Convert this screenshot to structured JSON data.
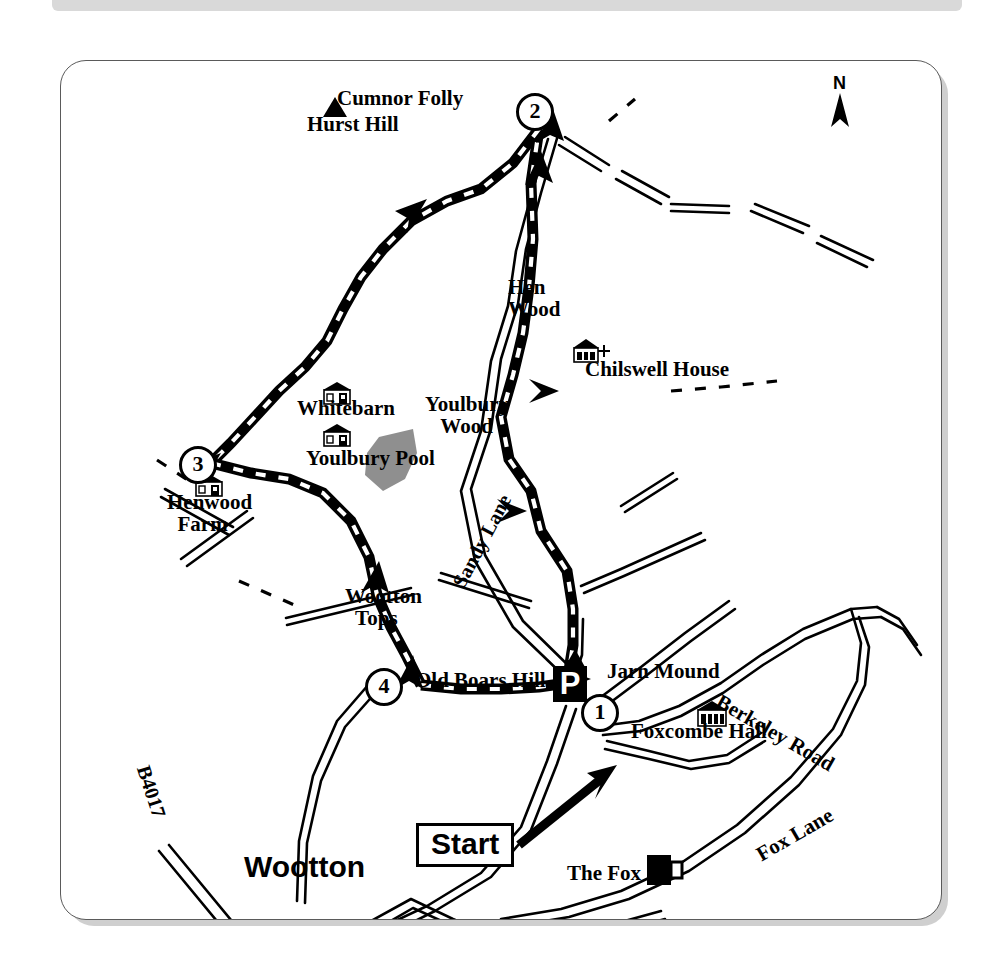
{
  "map": {
    "title": "Wootton / Boars Hill circular walk map",
    "orientation": {
      "north_label": "N"
    },
    "start_marker": {
      "label": "Start"
    },
    "parking_marker": {
      "label": "P"
    },
    "waypoints": [
      {
        "number": "1",
        "x": 596,
        "y": 709
      },
      {
        "number": "2",
        "x": 531,
        "y": 108
      },
      {
        "number": "3",
        "x": 194,
        "y": 461
      },
      {
        "number": "4",
        "x": 380,
        "y": 683
      }
    ],
    "place_labels": [
      {
        "id": "cumnor-folly",
        "text": "Cumnor Folly",
        "x": 336,
        "y": 97,
        "size": 21,
        "align": "left"
      },
      {
        "id": "hurst-hill",
        "text": "Hurst Hill",
        "x": 306,
        "y": 123,
        "size": 21,
        "align": "left"
      },
      {
        "id": "hen-wood",
        "text": "Hen\nWood",
        "x": 507,
        "y": 286,
        "size": 21,
        "align": "left"
      },
      {
        "id": "chilswell-house",
        "text": "Chilswell House",
        "x": 584,
        "y": 368,
        "size": 21,
        "align": "left"
      },
      {
        "id": "whitebarn",
        "text": "Whitebarn",
        "x": 296,
        "y": 407,
        "size": 21,
        "align": "left"
      },
      {
        "id": "youlbury-wood",
        "text": "Youlbury\n   Wood",
        "x": 424,
        "y": 403,
        "size": 21,
        "align": "left"
      },
      {
        "id": "youlbury-pool",
        "text": "Youlbury Pool",
        "x": 305,
        "y": 457,
        "size": 21,
        "align": "left"
      },
      {
        "id": "henwood-farm",
        "text": "Henwood\n  Farm",
        "x": 166,
        "y": 501,
        "size": 21,
        "align": "left"
      },
      {
        "id": "wootton-tops",
        "text": "Wootton\n  Tops",
        "x": 344,
        "y": 595,
        "size": 21,
        "align": "left"
      },
      {
        "id": "old-boars-hill",
        "text": "Old Boars Hill",
        "x": 414,
        "y": 679,
        "size": 21,
        "align": "left"
      },
      {
        "id": "jarn-mound",
        "text": "Jarn Mound",
        "x": 606,
        "y": 670,
        "size": 21,
        "align": "left"
      },
      {
        "id": "foxcombe-hall",
        "text": "Foxcombe Hall",
        "x": 630,
        "y": 730,
        "size": 21,
        "align": "left"
      },
      {
        "id": "the-fox",
        "text": "The Fox",
        "x": 566,
        "y": 872,
        "size": 21,
        "align": "left"
      },
      {
        "id": "wootton",
        "text": "Wootton",
        "x": 243,
        "y": 866,
        "size": 30,
        "align": "left",
        "font": "sans"
      }
    ],
    "road_labels": [
      {
        "id": "berkeley-road",
        "text": "Berkeley Road",
        "x": 722,
        "y": 700,
        "size": 21,
        "rotate": 30
      },
      {
        "id": "fox-lane",
        "text": "Fox Lane",
        "x": 752,
        "y": 856,
        "size": 21,
        "rotate": -30
      },
      {
        "id": "sandy-lane",
        "text": "Sandy Lane",
        "x": 448,
        "y": 590,
        "size": 20,
        "rotate": -62
      },
      {
        "id": "b4017",
        "text": "B4017",
        "x": 152,
        "y": 772,
        "size": 20,
        "rotate": 72
      }
    ],
    "symbols": [
      {
        "id": "hill-marker-hurst",
        "type": "triangle-peak",
        "x": 322,
        "y": 106
      },
      {
        "id": "hill-marker-jarn",
        "type": "triangle-peak",
        "x": 570,
        "y": 656
      },
      {
        "id": "building-chilswell",
        "type": "building",
        "x": 578,
        "y": 348
      },
      {
        "id": "church-cross",
        "type": "cross",
        "x": 602,
        "y": 344
      },
      {
        "id": "building-whitebarn",
        "type": "building",
        "x": 334,
        "y": 391
      },
      {
        "id": "building-youlbury",
        "type": "building",
        "x": 334,
        "y": 433
      },
      {
        "id": "building-henwood",
        "type": "building",
        "x": 204,
        "y": 483
      },
      {
        "id": "building-foxcombe",
        "type": "building",
        "x": 703,
        "y": 711
      },
      {
        "id": "pub-the-fox",
        "type": "beer-mug",
        "x": 652,
        "y": 864
      },
      {
        "id": "pool-youlbury",
        "type": "water-body",
        "x": 370,
        "y": 437
      }
    ],
    "legend_colors": {
      "route": "#000000",
      "road": "#000000",
      "water": "#8f8f8f",
      "frame": "#5a5a5a",
      "paper": "#ffffff"
    }
  }
}
